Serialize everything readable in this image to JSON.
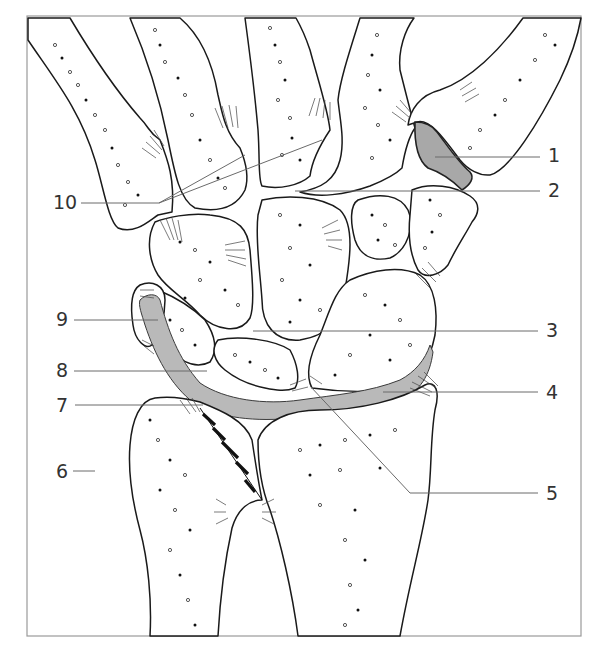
{
  "figure": {
    "frame": {
      "x": 27,
      "y": 16,
      "width": 554,
      "height": 620,
      "stroke": "#9a9a9a"
    },
    "colors": {
      "bone_outline": "#1a1a1a",
      "cartilage_fill": "#b9b9b9",
      "leader_line": "#6a6a6a",
      "label_text": "#333333"
    },
    "callouts": [
      {
        "number": "1",
        "side": "right",
        "label_x": 548,
        "label_y": 162,
        "line": [
          [
            435,
            157
          ],
          [
            540,
            157
          ]
        ]
      },
      {
        "number": "2",
        "side": "right",
        "label_x": 548,
        "label_y": 197,
        "line": [
          [
            295,
            191
          ],
          [
            540,
            191
          ]
        ]
      },
      {
        "number": "3",
        "side": "right",
        "label_x": 546,
        "label_y": 337,
        "line": [
          [
            253,
            331
          ],
          [
            538,
            331
          ]
        ]
      },
      {
        "number": "4",
        "side": "right",
        "label_x": 546,
        "label_y": 399,
        "line": [
          [
            383,
            392
          ],
          [
            538,
            392
          ]
        ]
      },
      {
        "number": "5",
        "side": "right",
        "label_x": 546,
        "label_y": 500,
        "line": [
          [
            310,
            386
          ],
          [
            410,
            493
          ],
          [
            538,
            493
          ]
        ]
      },
      {
        "number": "6",
        "side": "left",
        "label_x": 56,
        "label_y": 478,
        "line": [
          [
            73,
            471
          ],
          [
            95,
            471
          ]
        ]
      },
      {
        "number": "7",
        "side": "left",
        "label_x": 56,
        "label_y": 412,
        "line": [
          [
            75,
            405
          ],
          [
            203,
            405
          ]
        ]
      },
      {
        "number": "8",
        "side": "left",
        "label_x": 56,
        "label_y": 377,
        "line": [
          [
            74,
            371
          ],
          [
            207,
            371
          ]
        ]
      },
      {
        "number": "9",
        "side": "left",
        "label_x": 56,
        "label_y": 326,
        "line": [
          [
            74,
            320
          ],
          [
            158,
            320
          ]
        ]
      },
      {
        "number": "10",
        "side": "left",
        "label_x": 53,
        "label_y": 209,
        "line": [
          [
            81,
            203
          ],
          [
            159,
            203
          ]
        ],
        "extra_lines": [
          [
            [
              159,
              203
            ],
            [
              245,
              155
            ]
          ],
          [
            [
              159,
              203
            ],
            [
              322,
              140
            ]
          ]
        ]
      }
    ]
  }
}
